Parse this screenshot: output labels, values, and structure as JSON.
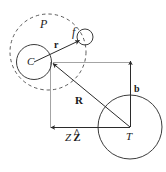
{
  "figure": {
    "background_color": "#ffffff",
    "stroke_color": "#3c3c3c",
    "label_color": "#1a1a1a",
    "width": 166,
    "height": 172,
    "labels": {
      "projectile_cloud": "P",
      "core": "C",
      "fragment": "f",
      "target": "T",
      "relative_vector": "r",
      "separation_vector": "R",
      "impact_parameter": "b",
      "axial_distance": "Z",
      "axial_unit_hat": "^",
      "axial_unit": "Z"
    },
    "shapes": [
      {
        "name": "projectile-dashed-circle",
        "label": "P",
        "cx": 48,
        "cy": 52,
        "r": 38,
        "style": "dashed"
      },
      {
        "name": "core-circle",
        "label": "C",
        "cx": 34,
        "cy": 62,
        "r": 17,
        "style": "solid"
      },
      {
        "name": "fragment-circle",
        "label": "f",
        "cx": 85,
        "cy": 37,
        "r": 8,
        "style": "solid"
      },
      {
        "name": "target-circle",
        "label": "T",
        "cx": 130,
        "cy": 127,
        "r": 32,
        "style": "solid"
      }
    ],
    "vectors": [
      {
        "name": "r-vector",
        "label": "r",
        "from": [
          34,
          62
        ],
        "to": [
          80,
          40
        ],
        "style": "solid-arrow"
      },
      {
        "name": "R-vector",
        "label": "R",
        "from": [
          130,
          127
        ],
        "to": [
          52,
          63
        ],
        "style": "solid-arrow"
      },
      {
        "name": "b-vector",
        "label": "b",
        "from": [
          130,
          127
        ],
        "to": [
          130,
          60
        ],
        "style": "solid-arrow"
      },
      {
        "name": "ZZhat-vector",
        "label": "Z Z",
        "from": [
          130,
          127
        ],
        "to": [
          50,
          127
        ],
        "style": "solid-arrow"
      }
    ],
    "construction_lines": [
      {
        "name": "horizontal-guide",
        "from": [
          52,
          62
        ],
        "to": [
          130,
          62
        ],
        "style": "thin"
      },
      {
        "name": "vertical-guide",
        "from": [
          50,
          62
        ],
        "to": [
          50,
          127
        ],
        "style": "thin"
      }
    ]
  }
}
